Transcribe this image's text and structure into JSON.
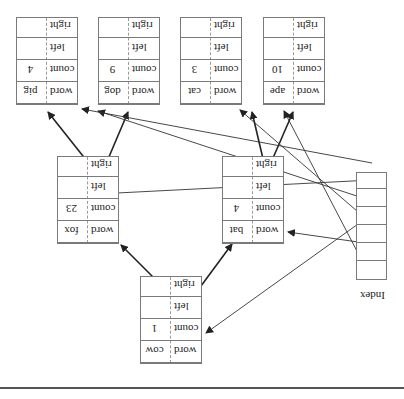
{
  "diagram": {
    "orientation": "rotated-180",
    "index": {
      "label": "Index",
      "cells": 6
    },
    "labels": {
      "word": "word",
      "count": "count",
      "left": "left",
      "right": "right"
    },
    "nodes": {
      "cow": {
        "word": "cow",
        "count": "1"
      },
      "bat": {
        "word": "bat",
        "count": "4"
      },
      "fox": {
        "word": "fox",
        "count": "23"
      },
      "ape": {
        "word": "ape",
        "count": "10"
      },
      "cat": {
        "word": "cat",
        "count": "3"
      },
      "dog": {
        "word": "dog",
        "count": "9"
      },
      "pig": {
        "word": "pig",
        "count": "4"
      }
    },
    "tree_edges": [
      {
        "from": "cow",
        "field": "left",
        "to": "bat"
      },
      {
        "from": "cow",
        "field": "right",
        "to": "fox"
      },
      {
        "from": "bat",
        "field": "left",
        "to": "ape"
      },
      {
        "from": "bat",
        "field": "right",
        "to": "cat"
      },
      {
        "from": "fox",
        "field": "left",
        "to": "dog"
      },
      {
        "from": "fox",
        "field": "right",
        "to": "pig"
      }
    ],
    "index_edges": [
      {
        "cell": 1,
        "to": "ape"
      },
      {
        "cell": 2,
        "to": "bat"
      },
      {
        "cell": 3,
        "to": "cat"
      },
      {
        "cell": 4,
        "to": "cow"
      },
      {
        "cell": 5,
        "to": "dog"
      },
      {
        "cell": 6,
        "to": "fox"
      },
      {
        "cell": 0,
        "to": "pig"
      }
    ],
    "colors": {
      "box_border": "#7a7a7a",
      "line": "#333333",
      "rule": "#555555"
    }
  }
}
